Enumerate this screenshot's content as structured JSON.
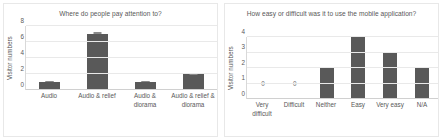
{
  "chart_data": [
    {
      "type": "bar",
      "title": "Where do people pay attention to?",
      "xlabel": "",
      "ylabel": "Visitor numbers",
      "categories": [
        "Audio",
        "Audio & relief",
        "Audio & diorama",
        "Audio & relief & diorama"
      ],
      "values": [
        1,
        7,
        1,
        2
      ],
      "errors_upper": [
        0.6,
        0.3,
        0.8,
        0.1
      ],
      "value_labels": [
        "",
        "",
        "",
        ""
      ],
      "yticks": [
        0,
        2,
        4,
        6,
        8
      ],
      "ylim": [
        0,
        8
      ],
      "grid": true,
      "legend": "none",
      "bar_color": "#595959",
      "gridline_color": "#e9e9e9",
      "axis_color": "#d9d9d9",
      "text_color": "#585858"
    },
    {
      "type": "bar",
      "title": "How easy or difficult was it to use the mobile application?",
      "xlabel": "",
      "ylabel": "Visitor numbers",
      "categories": [
        "Very difficult",
        "Difficult",
        "Neither",
        "Easy",
        "Very easy",
        "N/A"
      ],
      "values": [
        0,
        0,
        2,
        4,
        3,
        2
      ],
      "errors_upper": [
        0,
        0,
        0,
        0,
        0,
        0
      ],
      "value_labels": [
        "0",
        "0",
        "",
        "",
        "",
        ""
      ],
      "yticks": [
        0,
        1,
        2,
        3,
        4
      ],
      "ylim": [
        0,
        4
      ],
      "grid": true,
      "legend": "none",
      "bar_color": "#595959",
      "gridline_color": "#e9e9e9",
      "axis_color": "#d9d9d9",
      "text_color": "#585858"
    }
  ]
}
